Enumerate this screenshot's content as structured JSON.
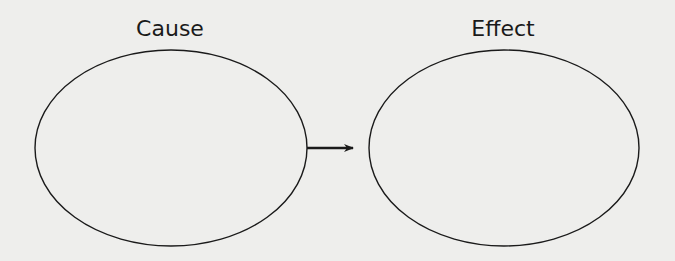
{
  "diagram": {
    "type": "cause-effect",
    "nodes": [
      {
        "id": "cause",
        "label": "Cause",
        "content": ""
      },
      {
        "id": "effect",
        "label": "Effect",
        "content": ""
      }
    ],
    "edges": [
      {
        "from": "cause",
        "to": "effect"
      }
    ],
    "colors": {
      "background": "#eeeeec",
      "stroke": "#1a1a1a"
    }
  }
}
